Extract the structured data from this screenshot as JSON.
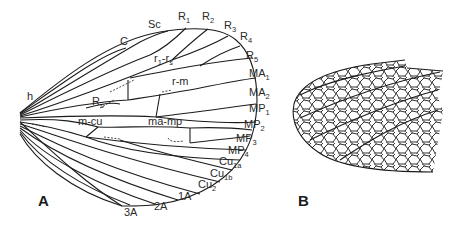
{
  "figure": {
    "panels": [
      {
        "id": "A",
        "label": "A",
        "description": "Wing with labeled venation",
        "margin_labels": {
          "C": "C",
          "Sc": "Sc",
          "R1": {
            "base": "R",
            "sub": "1"
          },
          "R2": {
            "base": "R",
            "sub": "2"
          },
          "R3": {
            "base": "R",
            "sub": "3"
          },
          "R4": {
            "base": "R",
            "sub": "4"
          },
          "R5": {
            "base": "R",
            "sub": "5"
          },
          "MA1": {
            "base": "MA",
            "sub": "1"
          },
          "MA2": {
            "base": "MA",
            "sub": "2"
          },
          "MP1": {
            "base": "MP",
            "sub": "1"
          },
          "MP2": {
            "base": "MP",
            "sub": "2"
          },
          "MP3": {
            "base": "MP",
            "sub": "3"
          },
          "MP4": {
            "base": "MP",
            "sub": "4"
          },
          "Cu1a": {
            "base": "Cu",
            "sub": "1a"
          },
          "Cu1b": {
            "base": "Cu",
            "sub": "1b"
          },
          "Cu2": {
            "base": "Cu",
            "sub": "2"
          },
          "A1": "1A",
          "A2": "2A",
          "A3": "3A"
        },
        "crossvein_labels": {
          "h": "h",
          "r1rs": {
            "base1": "r",
            "sub1": "1",
            "mid": "-r",
            "sub2": "s"
          },
          "Rs": {
            "base": "R",
            "sub": "s"
          },
          "rm": "r-m",
          "mcu": "m-cu",
          "mamp": "ma-mp"
        }
      },
      {
        "id": "B",
        "label": "B",
        "description": "Wing tip with dense reticulate venation"
      }
    ]
  }
}
